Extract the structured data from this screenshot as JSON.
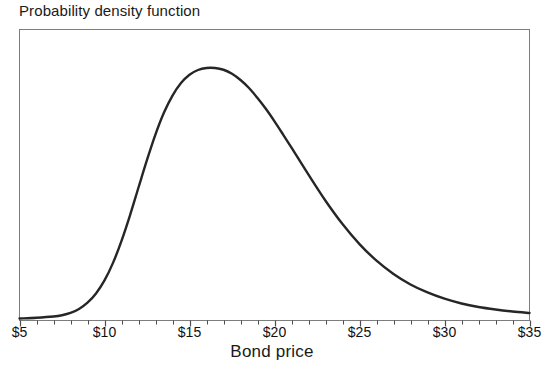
{
  "chart_data": {
    "type": "line",
    "title": "Probability density function",
    "subtitle": "",
    "xlabel": "Bond price",
    "ylabel": "",
    "xlim": [
      5,
      35
    ],
    "ylim": [
      0,
      1
    ],
    "grid": false,
    "legend": "none",
    "xtick_labels": [
      "$5",
      "$10",
      "$15",
      "$20",
      "$25",
      "$30",
      "$35"
    ],
    "xtick_values": [
      5,
      10,
      15,
      20,
      25,
      30,
      35
    ],
    "minor_tick_interval": 1,
    "ytick_labels": [],
    "annotations": [],
    "series": [
      {
        "name": "Probability density",
        "color": "#262626",
        "x": [
          5,
          6,
          7,
          7.5,
          8,
          8.5,
          9,
          9.5,
          10,
          10.5,
          11,
          11.5,
          12,
          12.5,
          13,
          13.5,
          14,
          14.5,
          15,
          15.5,
          16,
          16.5,
          17,
          17.5,
          18,
          18.5,
          19,
          19.5,
          20,
          20.5,
          21,
          22,
          23,
          24,
          25,
          26,
          27,
          28,
          29,
          30,
          31,
          32,
          33,
          34,
          35
        ],
        "values": [
          0.0,
          0.003,
          0.008,
          0.013,
          0.022,
          0.038,
          0.063,
          0.1,
          0.152,
          0.222,
          0.31,
          0.412,
          0.523,
          0.633,
          0.735,
          0.822,
          0.89,
          0.94,
          0.973,
          0.992,
          1.0,
          1.0,
          0.993,
          0.977,
          0.952,
          0.92,
          0.88,
          0.836,
          0.787,
          0.735,
          0.682,
          0.574,
          0.47,
          0.377,
          0.297,
          0.231,
          0.178,
          0.136,
          0.104,
          0.079,
          0.06,
          0.046,
          0.036,
          0.028,
          0.022
        ]
      }
    ],
    "peak": {
      "x": 16.8,
      "label": ""
    }
  },
  "frame": {
    "border_color": "#7d7d7d",
    "background": "#ffffff"
  }
}
